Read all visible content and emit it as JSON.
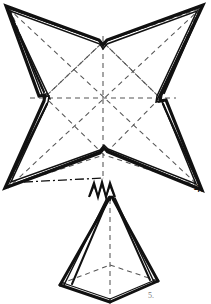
{
  "figure": {
    "kind": "line-drawing",
    "background_color": "#ffffff",
    "ink_color": "#111111",
    "dash_color": "#555555",
    "labels": [
      {
        "id": "step-4",
        "text": "4.",
        "x": 194,
        "y": 181
      },
      {
        "id": "step-5",
        "text": "5.",
        "x": 148,
        "y": 292
      }
    ],
    "star": {
      "name": "four-pointed-star-outline",
      "corners": [
        {
          "name": "top-left",
          "x": 6,
          "y": 6
        },
        {
          "name": "top-right",
          "x": 203,
          "y": 5
        },
        {
          "name": "bottom-right",
          "x": 202,
          "y": 190
        },
        {
          "name": "bottom-left",
          "x": 5,
          "y": 188
        }
      ],
      "notches": [
        {
          "name": "top-notch",
          "x": 103,
          "y": 42
        },
        {
          "name": "right-notch",
          "x": 160,
          "y": 98
        },
        {
          "name": "bottom-notch",
          "x": 104,
          "y": 155
        },
        {
          "name": "left-notch",
          "x": 45,
          "y": 97
        }
      ],
      "center": {
        "x": 103,
        "y": 98
      }
    },
    "pyramid": {
      "name": "folded-pyramid",
      "apex": {
        "x": 110,
        "y": 197
      },
      "base": [
        {
          "name": "left",
          "x": 60,
          "y": 285
        },
        {
          "name": "front",
          "x": 110,
          "y": 302
        },
        {
          "name": "right",
          "x": 158,
          "y": 281
        },
        {
          "name": "back",
          "x": 110,
          "y": 265
        }
      ]
    },
    "pleat_marker": {
      "name": "zigzag-pleat-marker",
      "x": 102,
      "y": 189,
      "peaks": 3
    }
  }
}
